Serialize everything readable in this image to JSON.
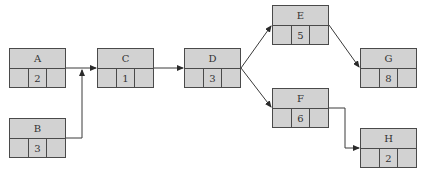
{
  "diagram": {
    "type": "activity-on-node network",
    "nodes": [
      {
        "id": "A",
        "label": "A",
        "duration": "2",
        "x": 9,
        "y": 48
      },
      {
        "id": "B",
        "label": "B",
        "duration": "3",
        "x": 9,
        "y": 118
      },
      {
        "id": "C",
        "label": "C",
        "duration": "1",
        "x": 97,
        "y": 48
      },
      {
        "id": "D",
        "label": "D",
        "duration": "3",
        "x": 184,
        "y": 48
      },
      {
        "id": "E",
        "label": "E",
        "duration": "5",
        "x": 272,
        "y": 5
      },
      {
        "id": "F",
        "label": "F",
        "duration": "6",
        "x": 272,
        "y": 88
      },
      {
        "id": "G",
        "label": "G",
        "duration": "8",
        "x": 360,
        "y": 48
      },
      {
        "id": "H",
        "label": "H",
        "duration": "2",
        "x": 360,
        "y": 128
      }
    ],
    "edges": [
      {
        "from": "A",
        "to": "C"
      },
      {
        "from": "B",
        "to": "C"
      },
      {
        "from": "C",
        "to": "D"
      },
      {
        "from": "D",
        "to": "E"
      },
      {
        "from": "D",
        "to": "F"
      },
      {
        "from": "E",
        "to": "G"
      },
      {
        "from": "F",
        "to": "H"
      }
    ],
    "colors": {
      "node_fill": "#d2d2d2",
      "node_border": "#4a4a4a",
      "edge": "#3a3a3a",
      "background": "#ffffff"
    }
  }
}
